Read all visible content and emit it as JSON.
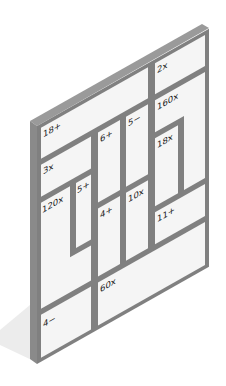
{
  "puzzle": {
    "type": "kenken",
    "size": 6,
    "colors": {
      "board_face": "#f4f4f4",
      "wall": "#808080",
      "edge": "#9a9a9a",
      "shadow": "#e6e6e6",
      "text": "#222222"
    },
    "cages": [
      {
        "id": "c1",
        "clue": "18+",
        "cells": [
          [
            0,
            0
          ],
          [
            0,
            1
          ],
          [
            0,
            2
          ],
          [
            0,
            3
          ]
        ]
      },
      {
        "id": "c2",
        "clue": "2x",
        "cells": [
          [
            0,
            4
          ],
          [
            0,
            5
          ]
        ]
      },
      {
        "id": "c3",
        "clue": "3x",
        "cells": [
          [
            1,
            0
          ],
          [
            1,
            1
          ]
        ]
      },
      {
        "id": "c4",
        "clue": "6+",
        "cells": [
          [
            1,
            2
          ],
          [
            2,
            2
          ]
        ]
      },
      {
        "id": "c5",
        "clue": "5−",
        "cells": [
          [
            1,
            3
          ],
          [
            2,
            3
          ]
        ]
      },
      {
        "id": "c6",
        "clue": "160x",
        "cells": [
          [
            1,
            4
          ],
          [
            1,
            5
          ],
          [
            2,
            5
          ],
          [
            3,
            5
          ]
        ]
      },
      {
        "id": "c7",
        "clue": "18x",
        "cells": [
          [
            2,
            4
          ],
          [
            3,
            4
          ]
        ]
      },
      {
        "id": "c8",
        "clue": "120x",
        "cells": [
          [
            2,
            0
          ],
          [
            3,
            0
          ],
          [
            4,
            0
          ],
          [
            4,
            1
          ]
        ]
      },
      {
        "id": "c9",
        "clue": "5+",
        "cells": [
          [
            2,
            1
          ],
          [
            3,
            1
          ]
        ]
      },
      {
        "id": "c10",
        "clue": "4+",
        "cells": [
          [
            3,
            2
          ],
          [
            4,
            2
          ]
        ]
      },
      {
        "id": "c11",
        "clue": "10x",
        "cells": [
          [
            3,
            3
          ],
          [
            4,
            3
          ]
        ]
      },
      {
        "id": "c12",
        "clue": "11+",
        "cells": [
          [
            4,
            4
          ],
          [
            4,
            5
          ]
        ]
      },
      {
        "id": "c13",
        "clue": "4−",
        "cells": [
          [
            5,
            0
          ],
          [
            5,
            1
          ]
        ]
      },
      {
        "id": "c14",
        "clue": "60x",
        "cells": [
          [
            5,
            2
          ],
          [
            5,
            3
          ],
          [
            5,
            4
          ],
          [
            5,
            5
          ]
        ]
      }
    ]
  },
  "labels": {
    "c1": "18+",
    "c2": "2x",
    "c3": "3x",
    "c4": "6+",
    "c5": "5−",
    "c6": "160x",
    "c7": "18x",
    "c8": "120x",
    "c9": "5+",
    "c10": "4+",
    "c11": "10x",
    "c12": "11+",
    "c13": "4−",
    "c14": "60x"
  }
}
